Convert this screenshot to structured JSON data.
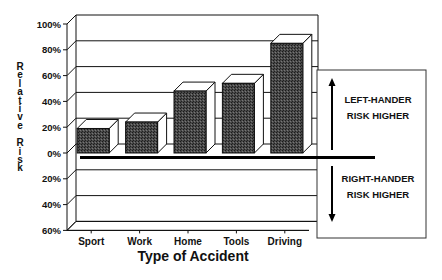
{
  "chart_data": {
    "type": "bar",
    "title": "",
    "xlabel": "Type of Accident",
    "ylabel": "Relative Risk",
    "categories": [
      "Sport",
      "Work",
      "Home",
      "Tools",
      "Driving"
    ],
    "values": [
      19,
      24,
      48,
      54,
      85
    ],
    "unit": "%",
    "ylim": [
      -60,
      100
    ],
    "yticks": [
      100,
      80,
      60,
      40,
      20,
      0,
      -20,
      -40,
      -60
    ],
    "ytick_labels": [
      "100%",
      "80%",
      "60%",
      "40%",
      "20%",
      "0%",
      "20%",
      "40%",
      "60%"
    ],
    "grid": true,
    "style": "3d-bar",
    "annotations": [
      {
        "text_lines": [
          "LEFT-HANDER",
          "RISK HIGHER"
        ],
        "direction": "up"
      },
      {
        "text_lines": [
          "RIGHT-HANDER",
          "RISK HIGHER"
        ],
        "direction": "down"
      }
    ],
    "colors": {
      "bar": "#3a3a3a",
      "line": "#111111",
      "background": "#ffffff"
    }
  },
  "ylabel_chars": [
    "R",
    "e",
    "l",
    "a",
    "t",
    "i",
    "v",
    "e",
    "",
    "R",
    "i",
    "s",
    "k"
  ]
}
